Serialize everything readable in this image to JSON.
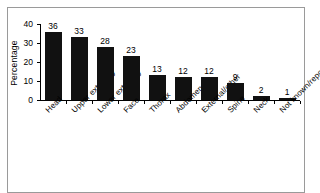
{
  "figure": {
    "background_color": "#ffffff",
    "frame_color": "#9a9a9a",
    "bar_color": "#111111"
  },
  "chart_data": {
    "type": "bar",
    "title": "",
    "xlabel": "",
    "ylabel": "Percentage",
    "ylim": [
      0,
      40
    ],
    "yticks": [
      0,
      10,
      20,
      30,
      40
    ],
    "ytick_labels": [
      "0",
      "10",
      "20",
      "30",
      "40"
    ],
    "grid": false,
    "legend": null,
    "categories": [
      "Head",
      "Upper extremity",
      "Lower extremity",
      "Face",
      "Thorax",
      "Abdomen",
      "External/other",
      "Spine",
      "Neck",
      "Not known/reported"
    ],
    "values": [
      36,
      33,
      28,
      23,
      13,
      12,
      12,
      9,
      2,
      1
    ],
    "value_labels": [
      "36",
      "33",
      "28",
      "23",
      "13",
      "12",
      "12",
      "9",
      "2",
      "1"
    ]
  }
}
